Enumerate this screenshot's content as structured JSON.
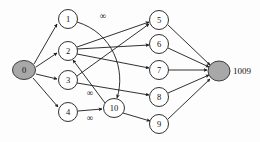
{
  "figure": {
    "type": "directed-graph",
    "background_color": "#fdfdfd",
    "edge_color": "#1a1a1a",
    "node_fill": "#ffffff",
    "terminal_node_fill": "#a8a8a8",
    "width": 260,
    "height": 142
  },
  "nodes": [
    {
      "id": "0",
      "label": "0",
      "cx": 24,
      "cy": 70,
      "rx": 11.5,
      "ry": 9.5,
      "style": "terminal"
    },
    {
      "id": "1",
      "label": "1",
      "cx": 68,
      "cy": 19,
      "rx": 9.5,
      "ry": 9.5,
      "style": "normal"
    },
    {
      "id": "2",
      "label": "2",
      "cx": 68,
      "cy": 51,
      "rx": 9.5,
      "ry": 9.5,
      "style": "normal"
    },
    {
      "id": "3",
      "label": "3",
      "cx": 68,
      "cy": 80,
      "rx": 9.5,
      "ry": 9.5,
      "style": "normal"
    },
    {
      "id": "4",
      "label": "4",
      "cx": 68,
      "cy": 112,
      "rx": 9.5,
      "ry": 9.5,
      "style": "normal"
    },
    {
      "id": "10",
      "label": "10",
      "cx": 114,
      "cy": 108,
      "rx": 10.5,
      "ry": 9.5,
      "style": "normal"
    },
    {
      "id": "5",
      "label": "5",
      "cx": 159,
      "cy": 20,
      "rx": 9.5,
      "ry": 9.5,
      "style": "normal"
    },
    {
      "id": "6",
      "label": "6",
      "cx": 159,
      "cy": 44,
      "rx": 9.5,
      "ry": 9.5,
      "style": "normal"
    },
    {
      "id": "7",
      "label": "7",
      "cx": 159,
      "cy": 70,
      "rx": 9.5,
      "ry": 9.5,
      "style": "normal"
    },
    {
      "id": "8",
      "label": "8",
      "cx": 159,
      "cy": 97,
      "rx": 9.5,
      "ry": 9.5,
      "style": "normal"
    },
    {
      "id": "9",
      "label": "9",
      "cx": 159,
      "cy": 124,
      "rx": 9.5,
      "ry": 9.5,
      "style": "normal"
    },
    {
      "id": "1009",
      "label": "",
      "cx": 219,
      "cy": 71,
      "rx": 11.0,
      "ry": 10.0,
      "style": "terminal"
    }
  ],
  "side_labels": [
    {
      "id": "terminal-label",
      "text": "1009",
      "x": 233,
      "y": 71
    }
  ],
  "edges": [
    {
      "id": "e-0-1",
      "from": "0",
      "to": "1",
      "d": "M 34 64 L 57 24",
      "curved": false
    },
    {
      "id": "e-0-2",
      "from": "0",
      "to": "2",
      "d": "M 36 67 L 57 53",
      "curved": false
    },
    {
      "id": "e-0-3",
      "from": "0",
      "to": "3",
      "d": "M 36 74 L 57 79",
      "curved": false
    },
    {
      "id": "e-0-4",
      "from": "0",
      "to": "4",
      "d": "M 33 78 L 58 107",
      "curved": false
    },
    {
      "id": "e-1-10",
      "from": "1",
      "to": "10",
      "d": "M 77 22 C 113 33 126 70 117 98",
      "curved": true
    },
    {
      "id": "e-2-5",
      "from": "2",
      "to": "5",
      "d": "M 77 47 L 149 22",
      "curved": false
    },
    {
      "id": "e-2-6",
      "from": "2",
      "to": "6",
      "d": "M 77 49 L 149 45",
      "curved": false
    },
    {
      "id": "e-2-7",
      "from": "2",
      "to": "7",
      "d": "M 77 54 L 149 68",
      "curved": false
    },
    {
      "id": "e-3-5",
      "from": "3",
      "to": "5",
      "d": "M 77 76 L 149 24",
      "curved": false
    },
    {
      "id": "e-3-8",
      "from": "3",
      "to": "8",
      "d": "M 77 83 L 149 95",
      "curved": false
    },
    {
      "id": "e-10-2",
      "from": "10",
      "to": "2",
      "d": "M 105 103 L 73 60",
      "curved": false
    },
    {
      "id": "e-4-10",
      "from": "4",
      "to": "10",
      "d": "M 78 111 L 102 109",
      "curved": false
    },
    {
      "id": "e-10-9",
      "from": "10",
      "to": "9",
      "d": "M 123 113 L 150 121",
      "curved": false
    },
    {
      "id": "e-5-t",
      "from": "5",
      "to": "1009",
      "d": "M 168 25 L 210 65",
      "curved": false
    },
    {
      "id": "e-6-t",
      "from": "6",
      "to": "1009",
      "d": "M 168 48 L 209 67",
      "curved": false
    },
    {
      "id": "e-7-t",
      "from": "7",
      "to": "1009",
      "d": "M 169 70 L 207 70",
      "curved": false
    },
    {
      "id": "e-8-t",
      "from": "8",
      "to": "1009",
      "d": "M 168 93 L 209 75",
      "curved": false
    },
    {
      "id": "e-9-t",
      "from": "9",
      "to": "1009",
      "d": "M 168 119 L 210 79",
      "curved": false
    }
  ],
  "edge_labels": [
    {
      "id": "label-1-10",
      "text": "∞",
      "x": 103,
      "y": 16,
      "edge": "e-1-10"
    },
    {
      "id": "label-10-2",
      "text": "∞",
      "x": 90,
      "y": 93,
      "edge": "e-10-2"
    },
    {
      "id": "label-4-10",
      "text": "∞",
      "x": 90,
      "y": 118,
      "edge": "e-4-10"
    }
  ]
}
